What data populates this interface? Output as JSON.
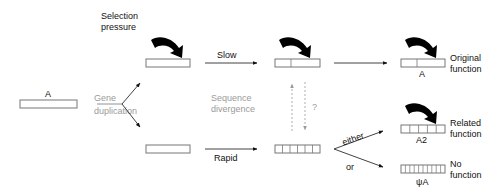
{
  "diagram": {
    "type": "gene-duplication-flow",
    "labels": {
      "selection_pressure_line1": "Selection",
      "selection_pressure_line2": "pressure",
      "original_gene": "A",
      "gene_duplication_line1": "Gene",
      "gene_duplication_line2": "duplication",
      "slow": "Slow",
      "rapid": "Rapid",
      "sequence_divergence_line1": "Sequence",
      "sequence_divergence_line2": "divergence",
      "question": "?",
      "either": "either",
      "or": "or",
      "outcome_original_gene": "A",
      "outcome_original_line1": "Original",
      "outcome_original_line2": "function",
      "outcome_related_gene": "A2",
      "outcome_related_line1": "Related",
      "outcome_related_line2": "function",
      "outcome_pseudo_gene": "ψA",
      "outcome_pseudo_line1": "No",
      "outcome_pseudo_line2": "function"
    },
    "nodes": [
      {
        "id": "A",
        "cells": 1
      },
      {
        "id": "dup-top",
        "cells": 1
      },
      {
        "id": "dup-bottom",
        "cells": 1
      },
      {
        "id": "slow-diverged",
        "cells": 2
      },
      {
        "id": "rapid-diverged",
        "cells": 6
      },
      {
        "id": "original",
        "cells": 2
      },
      {
        "id": "related",
        "cells": 5
      },
      {
        "id": "pseudogene",
        "cells": 10
      }
    ],
    "colors": {
      "ink": "#111111",
      "muted": "#9a9a9a",
      "box_border": "#777777"
    }
  }
}
